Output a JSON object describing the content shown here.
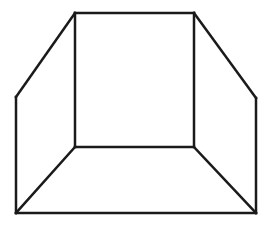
{
  "diagram": {
    "type": "line-drawing",
    "stroke_color": "#1a1a1a",
    "background_color": "#ffffff",
    "stroke_width": 2.5,
    "vertices": {
      "inner_top_left": [
        75,
        13
      ],
      "inner_top_right": [
        194,
        13
      ],
      "inner_bottom_right": [
        194,
        147
      ],
      "inner_bottom_left": [
        75,
        147
      ],
      "outer_left_top": [
        16,
        97
      ],
      "outer_right_top": [
        256,
        98
      ],
      "outer_bottom_left": [
        16,
        213
      ],
      "outer_bottom_right": [
        256,
        213
      ]
    },
    "edges": [
      {
        "name": "back-wall-top",
        "from": "inner_top_left",
        "to": "inner_top_right"
      },
      {
        "name": "back-wall-right",
        "from": "inner_top_right",
        "to": "inner_bottom_right"
      },
      {
        "name": "back-wall-bottom",
        "from": "inner_bottom_right",
        "to": "inner_bottom_left"
      },
      {
        "name": "back-wall-left",
        "from": "inner_bottom_left",
        "to": "inner_top_left"
      },
      {
        "name": "left-wall-top-edge",
        "from": "inner_top_left",
        "to": "outer_left_top"
      },
      {
        "name": "left-wall-outer-edge",
        "from": "outer_left_top",
        "to": "outer_bottom_left"
      },
      {
        "name": "left-floor-edge",
        "from": "inner_bottom_left",
        "to": "outer_bottom_left"
      },
      {
        "name": "right-wall-top-edge",
        "from": "inner_top_right",
        "to": "outer_right_top"
      },
      {
        "name": "right-wall-outer-edge",
        "from": "outer_right_top",
        "to": "outer_bottom_right"
      },
      {
        "name": "right-floor-edge",
        "from": "inner_bottom_right",
        "to": "outer_bottom_right"
      },
      {
        "name": "floor-front-edge",
        "from": "outer_bottom_left",
        "to": "outer_bottom_right"
      }
    ]
  }
}
